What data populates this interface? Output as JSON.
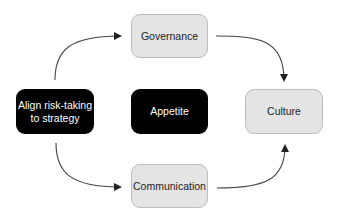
{
  "diagram": {
    "nodes": [
      {
        "id": "align",
        "label": "Align risk-taking to strategy",
        "line1": "Align risk-taking",
        "line2": "to strategy",
        "style": "dark"
      },
      {
        "id": "appetite",
        "label": "Appetite",
        "style": "dark"
      },
      {
        "id": "governance",
        "label": "Governance",
        "style": "light"
      },
      {
        "id": "communication",
        "label": "Communication",
        "style": "light"
      },
      {
        "id": "culture",
        "label": "Culture",
        "style": "light"
      }
    ],
    "edges": [
      {
        "from": "align",
        "to": "governance"
      },
      {
        "from": "align",
        "to": "communication"
      },
      {
        "from": "governance",
        "to": "culture"
      },
      {
        "from": "communication",
        "to": "culture"
      }
    ],
    "colors": {
      "dark_fill": "#000000",
      "light_fill": "#e4e4e4",
      "light_border": "#bdbdbd",
      "arrow": "#333333"
    }
  }
}
